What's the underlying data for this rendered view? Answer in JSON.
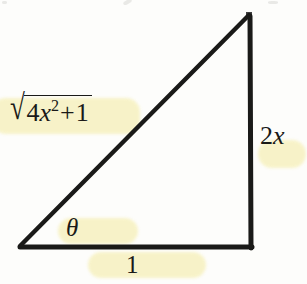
{
  "figure": {
    "kind": "right-triangle-diagram",
    "background_color": "#fdfdfb",
    "ink_color": "#1a1a18",
    "highlight_color": "#f7f2c4"
  },
  "labels": {
    "hypotenuse": {
      "radical_sign": "√",
      "coefficient": "4",
      "variable": "x",
      "exponent": "2",
      "operator": "+",
      "constant": "1",
      "plain_text": "√(4x² + 1)",
      "highlighted": true
    },
    "vertical_side": {
      "coefficient": "2",
      "variable": "x",
      "plain_text": "2x",
      "highlighted": true
    },
    "angle": {
      "symbol": "θ",
      "plain_text": "theta",
      "highlighted": true
    },
    "base": {
      "value": "1",
      "plain_text": "1",
      "highlighted": true
    }
  },
  "geometry": {
    "vertices": {
      "bottom_left": [
        20,
        247
      ],
      "bottom_right": [
        252,
        247
      ],
      "top_right": [
        250,
        15
      ]
    },
    "stroke_width": 4,
    "right_angle_at": "bottom_right"
  }
}
